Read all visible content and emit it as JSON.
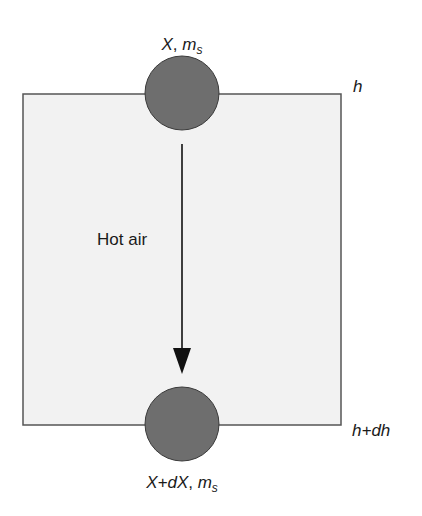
{
  "diagram": {
    "top_label": {
      "var": "X",
      "sep": ", ",
      "mass": "m",
      "mass_sub": "s"
    },
    "bottom_label": {
      "var": "X+dX",
      "sep": ", ",
      "mass": "m",
      "mass_sub": "s"
    },
    "height_top": "h",
    "height_bottom": "h+dh",
    "flow_label": "Hot air",
    "colors": {
      "box_fill": "#f2f2f2",
      "box_stroke": "#555555",
      "particle_fill": "#6e6e6e",
      "particle_stroke": "#3a3a3a",
      "arrow": "#111111"
    }
  }
}
